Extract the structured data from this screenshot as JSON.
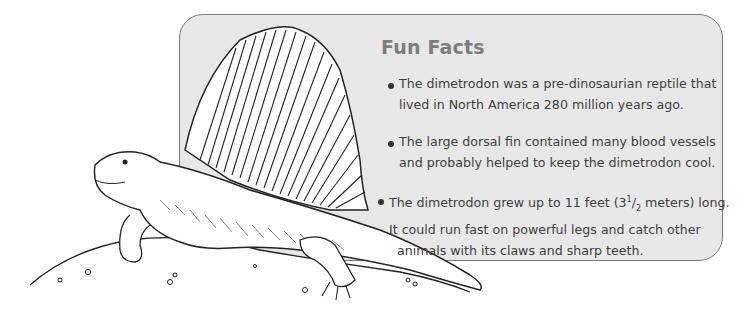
{
  "title": "Fun Facts",
  "facts": [
    {
      "lines": [
        "The dimetrodon was a pre-dinosaurian reptile that",
        "lived in North America 280 million years ago."
      ]
    },
    {
      "lines": [
        "The large dorsal fin contained many blood vessels",
        "and probably helped to keep the dimetrodon cool."
      ]
    },
    {
      "line1_before": "The dimetrodon grew up to 11 feet (3",
      "line1_sup": "1",
      "line1_slash": "/",
      "line1_sub": "2",
      "line1_after": " meters) long.",
      "lines": [
        "It could run fast on powerful legs and catch other",
        "animals with its claws and sharp teeth."
      ]
    }
  ],
  "illustration": {
    "subject": "dimetrodon",
    "style": "black ink line drawing"
  },
  "colors": {
    "box_background": "#e7e7e7",
    "box_border": "#7a7a7a",
    "title": "#7c7c7c",
    "body_text": "#3e3e3e"
  }
}
